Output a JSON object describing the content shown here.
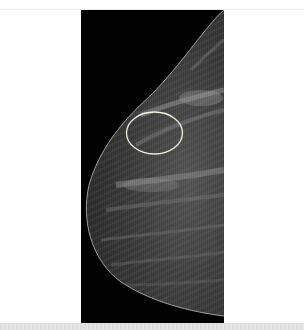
{
  "image": {
    "type": "mammogram",
    "view": "breast profile, tissue facing left",
    "background_color": "#000000",
    "annotation": {
      "shape": "ellipse",
      "color": "#f2f0e0",
      "label": "region of interest"
    }
  },
  "colors": {
    "page_background": "#ffffff",
    "bottom_strip": "#e0e0e0"
  }
}
